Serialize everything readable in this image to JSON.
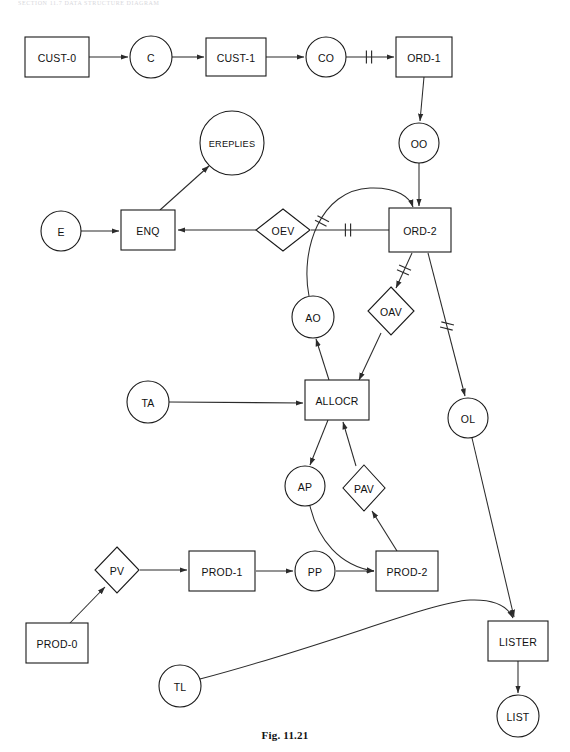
{
  "page": {
    "running_head": "SECTION 11.7    DATA STRUCTURE DIAGRAM",
    "caption": "Fig. 11.21",
    "width": 570,
    "height": 752,
    "background": "#ffffff",
    "ink": "#1a1a1a"
  },
  "diagram": {
    "type": "data-structure-diagram",
    "notation": {
      "box": "record / file type",
      "circle": "data item / set occurrence",
      "diamond": "validation or decision process",
      "double-tick": "one-to-one relationship marker"
    },
    "nodes": [
      {
        "id": "CUST-0",
        "label": "CUST-0",
        "shape": "box",
        "x": 57,
        "y": 57,
        "w": 64,
        "h": 40
      },
      {
        "id": "C",
        "label": "C",
        "shape": "circle",
        "x": 151,
        "y": 57,
        "r": 21
      },
      {
        "id": "CUST-1",
        "label": "CUST-1",
        "shape": "box",
        "x": 236,
        "y": 57,
        "w": 60,
        "h": 38
      },
      {
        "id": "CO",
        "label": "CO",
        "shape": "circle",
        "x": 326,
        "y": 57,
        "r": 20
      },
      {
        "id": "ORD-1",
        "label": "ORD-1",
        "shape": "box",
        "x": 424,
        "y": 57,
        "w": 56,
        "h": 40
      },
      {
        "id": "OO",
        "label": "OO",
        "shape": "circle",
        "x": 419,
        "y": 143,
        "r": 20
      },
      {
        "id": "EREPLIES",
        "label": "EREPLIES",
        "shape": "circle",
        "x": 232,
        "y": 143,
        "r": 32
      },
      {
        "id": "E",
        "label": "E",
        "shape": "circle",
        "x": 61,
        "y": 231,
        "r": 20
      },
      {
        "id": "ENQ",
        "label": "ENQ",
        "shape": "box",
        "x": 148,
        "y": 230,
        "w": 54,
        "h": 40
      },
      {
        "id": "OEV",
        "label": "OEV",
        "shape": "diamond",
        "x": 283,
        "y": 230,
        "w": 54,
        "h": 42
      },
      {
        "id": "ORD-2",
        "label": "ORD-2",
        "shape": "box",
        "x": 420,
        "y": 230,
        "w": 62,
        "h": 44
      },
      {
        "id": "AO",
        "label": "AO",
        "shape": "circle",
        "x": 313,
        "y": 317,
        "r": 21
      },
      {
        "id": "OAV",
        "label": "OAV",
        "shape": "diamond",
        "x": 391,
        "y": 311,
        "w": 46,
        "h": 48
      },
      {
        "id": "TA",
        "label": "TA",
        "shape": "circle",
        "x": 148,
        "y": 402,
        "r": 21
      },
      {
        "id": "ALLOCR",
        "label": "ALLOCR",
        "shape": "box",
        "x": 337,
        "y": 400,
        "w": 64,
        "h": 40
      },
      {
        "id": "OL",
        "label": "OL",
        "shape": "circle",
        "x": 468,
        "y": 418,
        "r": 20
      },
      {
        "id": "AP",
        "label": "AP",
        "shape": "circle",
        "x": 305,
        "y": 486,
        "r": 20
      },
      {
        "id": "PAV",
        "label": "PAV",
        "shape": "diamond",
        "x": 364,
        "y": 488,
        "w": 42,
        "h": 46
      },
      {
        "id": "PV",
        "label": "PV",
        "shape": "diamond",
        "x": 117,
        "y": 570,
        "w": 44,
        "h": 46
      },
      {
        "id": "PROD-1",
        "label": "PROD-1",
        "shape": "box",
        "x": 222,
        "y": 571,
        "w": 66,
        "h": 40
      },
      {
        "id": "PP",
        "label": "PP",
        "shape": "circle",
        "x": 315,
        "y": 571,
        "r": 20
      },
      {
        "id": "PROD-2",
        "label": "PROD-2",
        "shape": "box",
        "x": 407,
        "y": 571,
        "w": 62,
        "h": 40
      },
      {
        "id": "PROD-0",
        "label": "PROD-0",
        "shape": "box",
        "x": 57,
        "y": 643,
        "w": 62,
        "h": 40
      },
      {
        "id": "TL",
        "label": "TL",
        "shape": "circle",
        "x": 180,
        "y": 686,
        "r": 21
      },
      {
        "id": "LISTER",
        "label": "LISTER",
        "shape": "box",
        "x": 518,
        "y": 641,
        "w": 60,
        "h": 40
      },
      {
        "id": "LIST",
        "label": "LIST",
        "shape": "circle",
        "x": 518,
        "y": 716,
        "r": 21
      }
    ],
    "edges": [
      {
        "id": "e-cust0-c",
        "from": "CUST-0",
        "to": "C",
        "path": "M 89,57 L 128,57",
        "arrow": true,
        "ticks": []
      },
      {
        "id": "e-c-cust1",
        "from": "C",
        "to": "CUST-1",
        "path": "M 172,57 L 204,57",
        "arrow": true,
        "ticks": []
      },
      {
        "id": "e-cust1-co",
        "from": "CUST-1",
        "to": "CO",
        "path": "M 266,57 L 304,57",
        "arrow": true,
        "ticks": []
      },
      {
        "id": "e-co-ord1",
        "from": "CO",
        "to": "ORD-1",
        "path": "M 346,57 L 394,57",
        "arrow": true,
        "ticks": [
          {
            "x": 369,
            "y": 57,
            "angle": 0
          }
        ]
      },
      {
        "id": "e-ord1-oo",
        "from": "ORD-1",
        "to": "OO",
        "path": "M 424,77 L 420,121",
        "arrow": true,
        "ticks": []
      },
      {
        "id": "e-oo-ord2",
        "from": "OO",
        "to": "ORD-2",
        "path": "M 419,163 L 419,206",
        "arrow": true,
        "ticks": []
      },
      {
        "id": "e-enq-ereplies",
        "from": "ENQ",
        "to": "EREPLIES",
        "path": "M 160,210 L 209,166",
        "arrow": true,
        "ticks": []
      },
      {
        "id": "e-e-enq",
        "from": "E",
        "to": "ENQ",
        "path": "M 81,231 L 119,231",
        "arrow": true,
        "ticks": []
      },
      {
        "id": "e-oev-enq",
        "from": "OEV",
        "to": "ENQ",
        "path": "M 256,230 L 178,230",
        "arrow": true,
        "ticks": []
      },
      {
        "id": "e-ord2-oev",
        "from": "ORD-2",
        "to": "OEV",
        "path": "M 389,230 L 311,230",
        "arrow": false,
        "ticks": [
          {
            "x": 348,
            "y": 230,
            "angle": 0
          }
        ]
      },
      {
        "id": "e-ao-ord2",
        "from": "AO",
        "to": "ORD-2",
        "path": "M 309,296 C 300,250 320,190 370,188 C 398,187 410,198 413,207",
        "arrow": true,
        "ticks": [
          {
            "x": 322,
            "y": 221,
            "angle": -62
          }
        ]
      },
      {
        "id": "e-ord2-oav",
        "from": "ORD-2",
        "to": "OAV",
        "path": "M 412,253 L 396,288",
        "arrow": true,
        "ticks": [
          {
            "x": 404,
            "y": 270,
            "angle": -66
          }
        ]
      },
      {
        "id": "e-ord2-ol",
        "from": "ORD-2",
        "to": "OL",
        "path": "M 428,253 L 465,396",
        "arrow": true,
        "ticks": [
          {
            "x": 447,
            "y": 326,
            "angle": -76
          }
        ]
      },
      {
        "id": "e-oav-allocr",
        "from": "OAV",
        "to": "ALLOCR",
        "path": "M 381,333 L 359,380",
        "arrow": true,
        "ticks": []
      },
      {
        "id": "e-allocr-ao",
        "from": "ALLOCR",
        "to": "AO",
        "path": "M 329,380 L 316,339",
        "arrow": true,
        "ticks": []
      },
      {
        "id": "e-ta-allocr",
        "from": "TA",
        "to": "ALLOCR",
        "path": "M 169,402 L 303,403",
        "arrow": true,
        "ticks": []
      },
      {
        "id": "e-allocr-ap",
        "from": "ALLOCR",
        "to": "AP",
        "path": "M 328,420 L 310,465",
        "arrow": true,
        "ticks": []
      },
      {
        "id": "e-pav-allocr",
        "from": "PAV",
        "to": "ALLOCR",
        "path": "M 356,466 L 343,422",
        "arrow": true,
        "ticks": []
      },
      {
        "id": "e-prod2-pav",
        "from": "PROD-2",
        "to": "PAV",
        "path": "M 397,551 L 372,511",
        "arrow": true,
        "ticks": []
      },
      {
        "id": "e-ap-prod2",
        "from": "AP",
        "to": "PROD-2",
        "path": "M 310,506 C 318,540 340,566 374,571",
        "arrow": true,
        "ticks": []
      },
      {
        "id": "e-prod0-pv",
        "from": "PROD-0",
        "to": "PV",
        "path": "M 70,623 L 105,587",
        "arrow": true,
        "ticks": []
      },
      {
        "id": "e-pv-prod1",
        "from": "PV",
        "to": "PROD-1",
        "path": "M 140,570 L 187,570",
        "arrow": true,
        "ticks": []
      },
      {
        "id": "e-prod1-pp",
        "from": "PROD-1",
        "to": "PP",
        "path": "M 256,571 L 293,571",
        "arrow": true,
        "ticks": []
      },
      {
        "id": "e-pp-prod2",
        "from": "PP",
        "to": "PROD-2",
        "path": "M 336,571 L 374,571",
        "arrow": true,
        "ticks": []
      },
      {
        "id": "e-ol-lister",
        "from": "OL",
        "to": "LISTER",
        "path": "M 472,438 L 514,617",
        "arrow": true,
        "ticks": []
      },
      {
        "id": "e-tl-lister",
        "from": "TL",
        "to": "LISTER",
        "path": "M 200,679 C 330,645 430,602 470,600 C 495,599 508,607 513,618",
        "arrow": true,
        "ticks": []
      },
      {
        "id": "e-lister-list",
        "from": "LISTER",
        "to": "LIST",
        "path": "M 518,661 L 518,693",
        "arrow": true,
        "ticks": []
      }
    ]
  }
}
